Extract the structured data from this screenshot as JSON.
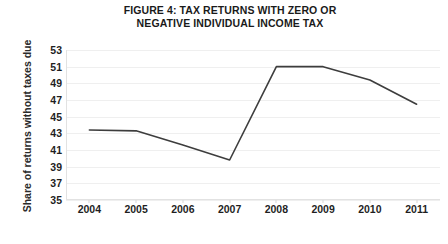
{
  "chart_data": {
    "type": "line",
    "title": "FIGURE 4: TAX RETURNS WITH ZERO OR NEGATIVE INDIVIDUAL INCOME TAX",
    "title_line1": "FIGURE 4: TAX RETURNS WITH ZERO OR",
    "title_line2": "NEGATIVE INDIVIDUAL INCOME TAX",
    "xlabel": "",
    "ylabel": "Share of returns without taxes due",
    "categories": [
      "2004",
      "2005",
      "2006",
      "2007",
      "2008",
      "2009",
      "2010",
      "2011"
    ],
    "x": [
      2004,
      2005,
      2006,
      2007,
      2008,
      2009,
      2010,
      2011
    ],
    "values": [
      43.4,
      43.3,
      41.6,
      39.8,
      51.0,
      51.0,
      49.4,
      46.5
    ],
    "series": [
      {
        "name": "Share of returns without taxes due",
        "values": [
          43.4,
          43.3,
          41.6,
          39.8,
          51.0,
          51.0,
          49.4,
          46.5
        ]
      }
    ],
    "ylim": [
      35,
      53
    ],
    "yticks": [
      53,
      51,
      49,
      47,
      45,
      43,
      41,
      39,
      37,
      35
    ],
    "ytick_labels": [
      "53",
      "51",
      "49",
      "47",
      "45",
      "43",
      "41",
      "39",
      "37",
      "35"
    ],
    "grid": true,
    "grid_axis": "y",
    "legend": false,
    "legend_position": "none",
    "line_color": "#3d3d3d",
    "grid_color": "#efefef",
    "axis_color": "#e2e2e2",
    "background_color": "#ffffff",
    "markers": false
  }
}
